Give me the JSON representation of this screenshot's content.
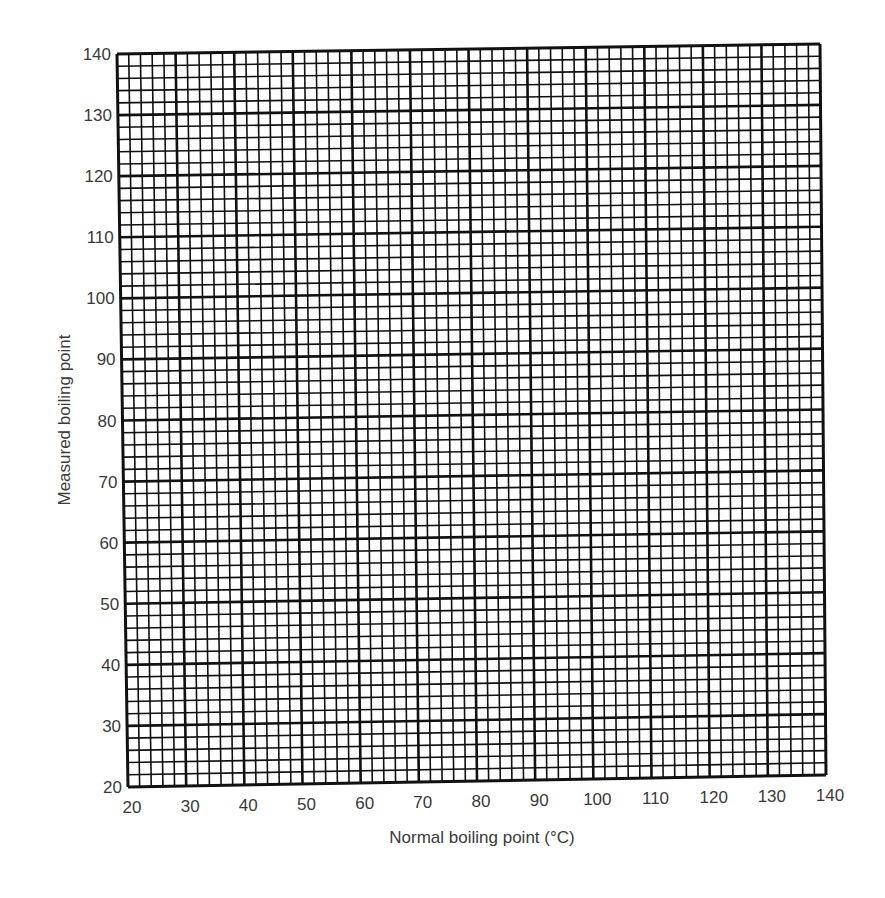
{
  "chart_data": {
    "type": "line",
    "title": "",
    "xlabel": "Normal boiling point (°C)",
    "ylabel": "Measured boiling point",
    "xlim": [
      20,
      140
    ],
    "ylim": [
      20,
      140
    ],
    "x_ticks": [
      20,
      30,
      40,
      50,
      60,
      70,
      80,
      90,
      100,
      110,
      120,
      130,
      140
    ],
    "y_ticks": [
      20,
      30,
      40,
      50,
      60,
      70,
      80,
      90,
      100,
      110,
      120,
      130,
      140
    ],
    "grid": {
      "on": true,
      "major_step": 10,
      "minor_step": 2
    },
    "series": [],
    "note": "Blank graph paper grid; no data plotted"
  },
  "colors": {
    "grid": "#111111",
    "text": "#3a3a3a",
    "background": "#ffffff"
  }
}
